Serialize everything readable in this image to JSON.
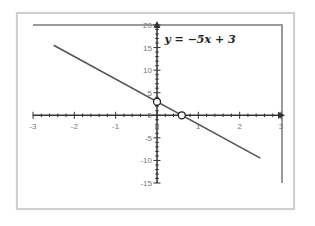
{
  "chart_data": {
    "type": "line",
    "title": "",
    "annotation": "y = −5x + 3",
    "xlabel": "",
    "ylabel": "",
    "xlim": [
      -3,
      3
    ],
    "ylim": [
      -15,
      20
    ],
    "x_ticks": [
      "-3",
      "-2",
      "-1",
      "0",
      "1",
      "2",
      "3"
    ],
    "y_ticks": [
      "20",
      "15",
      "10",
      "5",
      "0",
      "-5",
      "-10",
      "-15"
    ],
    "grid": false,
    "legend": null,
    "series": [
      {
        "name": "y = -5x + 3",
        "x": [
          -2.5,
          2.5
        ],
        "y": [
          15.5,
          -9.5
        ],
        "color": "#555555"
      }
    ],
    "points": [
      {
        "label": "y-intercept",
        "x": 0,
        "y": 3
      },
      {
        "label": "x-intercept",
        "x": 0.6,
        "y": 0
      }
    ]
  },
  "equation_label": "y = −5x + 3",
  "colors": {
    "line": "#555555",
    "axis": "#333333",
    "frame": "#cfcfcf",
    "plot_border": "#9a9a9a"
  }
}
